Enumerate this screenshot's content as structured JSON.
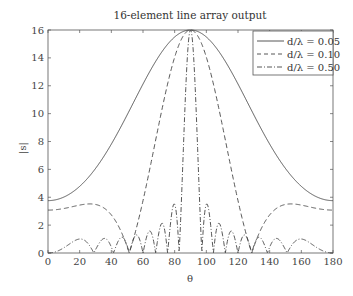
{
  "chart_data": {
    "type": "line",
    "title": "16-element line array output",
    "xlabel": "θ",
    "ylabel": "|s|",
    "xlim": [
      0,
      180
    ],
    "ylim": [
      0,
      16
    ],
    "xticks": [
      0,
      20,
      40,
      60,
      80,
      100,
      120,
      140,
      160,
      180
    ],
    "yticks": [
      0,
      2,
      4,
      6,
      8,
      10,
      12,
      14,
      16
    ],
    "grid": false,
    "legend_position": "upper right",
    "N": 16,
    "series": [
      {
        "name": "d/λ = 0.05",
        "d_over_lambda": 0.05,
        "style": "solid",
        "x": [
          0,
          20,
          40,
          60,
          80,
          90,
          100,
          120,
          140,
          160,
          180
        ],
        "values": [
          3.78,
          4.45,
          7.0,
          11.6,
          15.55,
          16.0,
          15.55,
          11.6,
          7.0,
          4.45,
          3.78
        ]
      },
      {
        "name": "d/λ = 0.10",
        "d_over_lambda": 0.1,
        "style": "dashed",
        "x": [
          0,
          20,
          30,
          40,
          50,
          60,
          70,
          80,
          90,
          100,
          110,
          120,
          130,
          140,
          150,
          160,
          180
        ],
        "values": [
          3.08,
          3.4,
          3.42,
          3.1,
          2.0,
          0.2,
          5.3,
          13.9,
          16.0,
          13.9,
          5.3,
          0.2,
          2.0,
          3.1,
          3.42,
          3.4,
          3.08
        ]
      },
      {
        "name": "d/λ = 0.50",
        "d_over_lambda": 0.5,
        "style": "dashdot",
        "x": [
          0,
          20,
          41,
          52,
          60,
          66,
          72,
          78,
          83,
          90,
          97,
          102,
          108,
          114,
          120,
          128,
          139,
          160,
          180
        ],
        "values": [
          0.0,
          1.0,
          0.0,
          0.8,
          0.0,
          1.0,
          0.0,
          1.5,
          3.5,
          16.0,
          3.5,
          1.5,
          0.0,
          1.0,
          0.0,
          0.8,
          0.0,
          1.0,
          0.0
        ]
      }
    ]
  },
  "labels": {
    "title": "16-element line array output",
    "xlabel": "θ",
    "ylabel": "|s|",
    "legend": [
      "d/λ = 0.05",
      "d/λ = 0.10",
      "d/λ = 0.50"
    ]
  }
}
